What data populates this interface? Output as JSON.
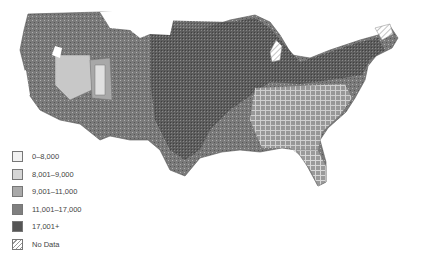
{
  "map": {
    "region": "Contiguous United States (counties)",
    "type": "choropleth"
  },
  "legend": {
    "items": [
      {
        "label": "0–8,000",
        "color": "#f2f2f2",
        "hatch": false
      },
      {
        "label": "8,001–9,000",
        "color": "#d6d6d6",
        "hatch": false
      },
      {
        "label": "9,001–11,000",
        "color": "#a9a9a9",
        "hatch": false
      },
      {
        "label": "11,001–17,000",
        "color": "#7f7f7f",
        "hatch": false
      },
      {
        "label": "17,001+",
        "color": "#555555",
        "hatch": false
      },
      {
        "label": "No Data",
        "color": "#ffffff",
        "hatch": true
      }
    ]
  }
}
